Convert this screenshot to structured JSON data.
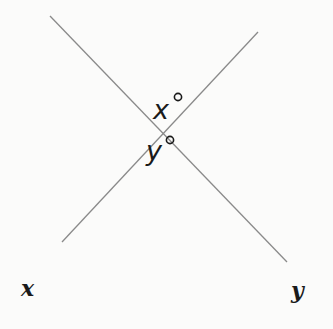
{
  "diagram": {
    "lines": [
      {
        "name": "x",
        "label": "x",
        "x1": 50,
        "y1": 16,
        "x2": 287,
        "y2": 262
      },
      {
        "name": "y",
        "label": "y",
        "x1": 258,
        "y1": 32,
        "x2": 62,
        "y2": 242
      }
    ],
    "intersection": {
      "x": 163,
      "y": 131
    },
    "angles": [
      {
        "name": "top-angle",
        "variable": "x",
        "unit_symbol": "°"
      },
      {
        "name": "bottom-angle",
        "variable": "y",
        "unit_symbol": "°"
      }
    ],
    "colors": {
      "line": "#8a8a8a",
      "text": "#1a1a1a",
      "background": "#fbfbfa"
    }
  }
}
